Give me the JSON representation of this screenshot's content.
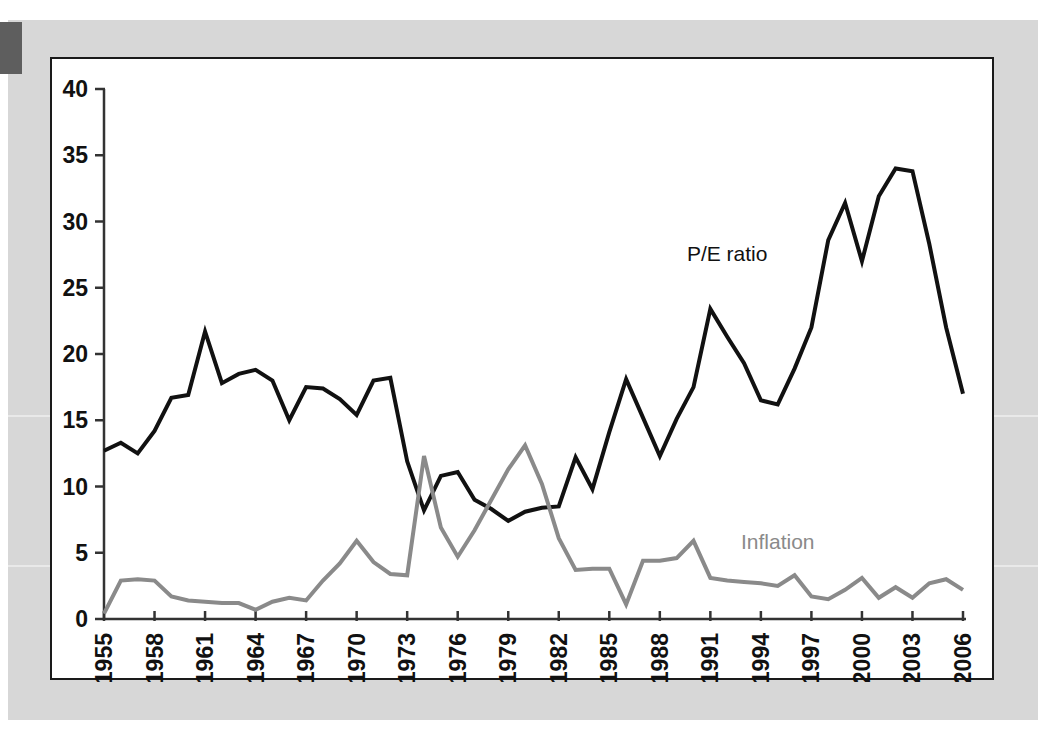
{
  "page": {
    "background_color": "#d7d7d7",
    "card_background": "#ffffff",
    "tab_color": "#5e5e5e"
  },
  "chart_data": {
    "type": "line",
    "title": "",
    "subtitle": "",
    "xlabel": "",
    "ylabel": "",
    "xlim": [
      1955,
      2006
    ],
    "ylim": [
      0,
      40
    ],
    "yticks": [
      0,
      5,
      10,
      15,
      20,
      25,
      30,
      35,
      40
    ],
    "ytick_labels": [
      "0",
      "5",
      "10",
      "15",
      "20",
      "25",
      "30",
      "35",
      "40"
    ],
    "xticks": [
      1955,
      1958,
      1961,
      1964,
      1967,
      1970,
      1973,
      1976,
      1979,
      1982,
      1985,
      1988,
      1991,
      1994,
      1997,
      2000,
      2003,
      2006
    ],
    "xtick_labels": [
      "1955",
      "1958",
      "1961",
      "1964",
      "1967",
      "1970",
      "1973",
      "1976",
      "1979",
      "1982",
      "1985",
      "1988",
      "1991",
      "1994",
      "1997",
      "2000",
      "2003",
      "2006"
    ],
    "xtick_rotation": -90,
    "grid": false,
    "legend_position": "inline-annotations",
    "x": [
      1955,
      1956,
      1957,
      1958,
      1959,
      1960,
      1961,
      1962,
      1963,
      1964,
      1965,
      1966,
      1967,
      1968,
      1969,
      1970,
      1971,
      1972,
      1973,
      1974,
      1975,
      1976,
      1977,
      1978,
      1979,
      1980,
      1981,
      1982,
      1983,
      1984,
      1985,
      1986,
      1987,
      1988,
      1989,
      1990,
      1991,
      1992,
      1993,
      1994,
      1995,
      1996,
      1997,
      1998,
      1999,
      2000,
      2001,
      2002,
      2003,
      2004,
      2005,
      2006
    ],
    "series": [
      {
        "name": "P/E ratio",
        "color": "#111111",
        "width": 4,
        "label_x": 1992,
        "label_y": 27.0,
        "values": [
          12.7,
          13.3,
          12.5,
          14.2,
          16.7,
          16.9,
          21.7,
          17.8,
          18.5,
          18.8,
          18.0,
          15.0,
          17.5,
          17.4,
          16.6,
          15.4,
          18.0,
          18.2,
          11.9,
          8.2,
          10.8,
          11.1,
          9.0,
          8.3,
          7.4,
          8.1,
          8.4,
          8.5,
          12.2,
          9.8,
          14.1,
          18.1,
          15.2,
          12.3,
          15.1,
          17.5,
          23.4,
          21.3,
          19.3,
          16.5,
          16.2,
          18.9,
          22.0,
          28.6,
          31.4,
          27.0,
          31.9,
          34.0,
          33.8,
          28.3,
          22.0,
          17.0
        ]
      },
      {
        "name": "Inflation",
        "color": "#8a8a8a",
        "width": 4,
        "label_x": 1995,
        "label_y": 5.3,
        "values": [
          0.4,
          2.9,
          3.0,
          2.9,
          1.7,
          1.4,
          1.3,
          1.2,
          1.2,
          0.7,
          1.3,
          1.6,
          1.4,
          2.9,
          4.2,
          5.9,
          4.3,
          3.4,
          3.3,
          12.3,
          6.9,
          4.7,
          6.7,
          9.0,
          11.3,
          13.1,
          10.2,
          6.1,
          3.7,
          3.8,
          3.8,
          1.1,
          4.4,
          4.4,
          4.6,
          5.9,
          3.1,
          2.9,
          2.8,
          2.7,
          2.5,
          3.3,
          1.7,
          1.5,
          2.2,
          3.1,
          1.6,
          2.4,
          1.6,
          2.7,
          3.0,
          2.2
        ]
      }
    ]
  }
}
